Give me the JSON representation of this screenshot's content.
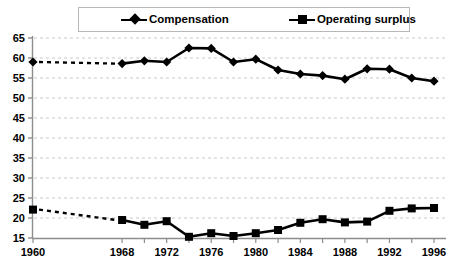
{
  "legend": {
    "entries": [
      {
        "label": "Compensation",
        "marker": "diamond-marker-icon",
        "color": "#000000"
      },
      {
        "label": "Operating surplus",
        "marker": "square-marker-icon",
        "color": "#000000"
      }
    ]
  },
  "axes": {
    "y_ticks": [
      "65",
      "60",
      "55",
      "50",
      "45",
      "40",
      "35",
      "30",
      "25",
      "20",
      "15"
    ],
    "x_ticks": [
      "1960",
      "1968",
      "1972",
      "1976",
      "1980",
      "1984",
      "1988",
      "1992",
      "1996"
    ]
  },
  "chart_data": {
    "type": "line",
    "title": "",
    "xlabel": "",
    "ylabel": "",
    "ylim": [
      15,
      65
    ],
    "ytick_step": 5,
    "grid": true,
    "grid_style": "dashed-horizontal",
    "legend_position": "top",
    "x": [
      1960,
      1968,
      1970,
      1972,
      1974,
      1976,
      1978,
      1980,
      1982,
      1984,
      1986,
      1988,
      1990,
      1992,
      1994,
      1996
    ],
    "x_labeled_ticks": [
      1960,
      1968,
      1972,
      1976,
      1980,
      1984,
      1988,
      1992,
      1996
    ],
    "gap_after_first_point": true,
    "series": [
      {
        "name": "Compensation",
        "marker": "diamond",
        "color": "#000000",
        "values": [
          59.0,
          58.6,
          59.3,
          59.0,
          62.5,
          62.4,
          59.0,
          59.7,
          57.0,
          56.0,
          55.6,
          54.7,
          57.3,
          57.2,
          55.0,
          54.2
        ]
      },
      {
        "name": "Operating surplus",
        "marker": "square",
        "color": "#000000",
        "values": [
          22.1,
          19.5,
          18.3,
          19.2,
          15.3,
          16.2,
          15.5,
          16.2,
          17.0,
          18.8,
          19.7,
          18.9,
          19.1,
          21.8,
          22.4,
          22.5
        ]
      }
    ]
  }
}
